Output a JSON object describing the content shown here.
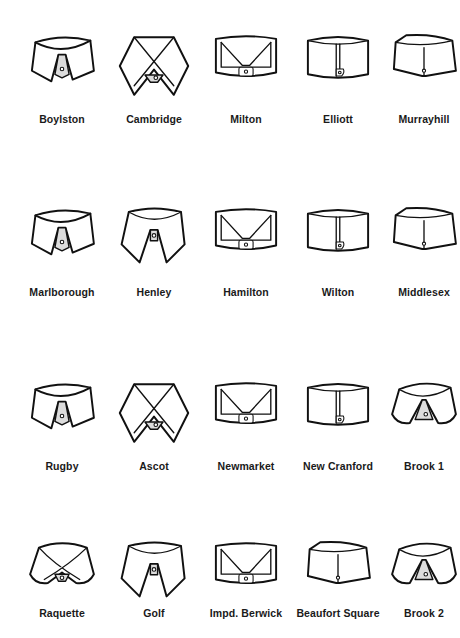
{
  "rows": [
    {
      "collars": [
        {
          "name": "Boylston",
          "style": "spread-tab"
        },
        {
          "name": "Cambridge",
          "style": "wing-cross"
        },
        {
          "name": "Milton",
          "style": "band-fold"
        },
        {
          "name": "Elliott",
          "style": "band-tab"
        },
        {
          "name": "Murrayhill",
          "style": "band-plain"
        }
      ]
    },
    {
      "collars": [
        {
          "name": "Marlborough",
          "style": "spread-tab"
        },
        {
          "name": "Henley",
          "style": "point-button"
        },
        {
          "name": "Hamilton",
          "style": "band-fold"
        },
        {
          "name": "Wilton",
          "style": "band-tab"
        },
        {
          "name": "Middlesex",
          "style": "band-plain"
        }
      ]
    },
    {
      "collars": [
        {
          "name": "Rugby",
          "style": "spread-tab"
        },
        {
          "name": "Ascot",
          "style": "wing-cross"
        },
        {
          "name": "Newmarket",
          "style": "band-fold"
        },
        {
          "name": "New Cranford",
          "style": "band-tab"
        },
        {
          "name": "Brook 1",
          "style": "round-club"
        }
      ]
    },
    {
      "collars": [
        {
          "name": "Raquette",
          "style": "round-cross"
        },
        {
          "name": "Golf",
          "style": "point-button"
        },
        {
          "name": "Impd. Berwick",
          "style": "band-fold"
        },
        {
          "name": "Beaufort Square",
          "style": "band-plain"
        },
        {
          "name": "Brook 2",
          "style": "round-club"
        }
      ]
    }
  ]
}
